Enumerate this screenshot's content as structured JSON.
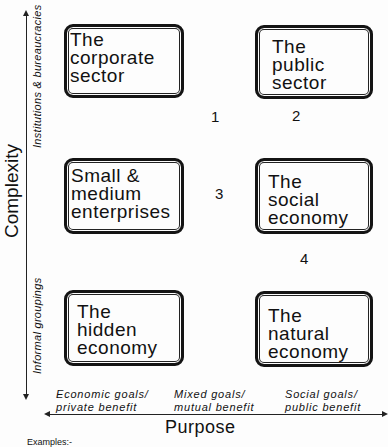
{
  "diagram": {
    "axes": {
      "vertical": {
        "title": "Complexity",
        "top_label": "Institutions & bureaucracies",
        "bottom_label": "Informal groupings"
      },
      "horizontal": {
        "title": "Purpose",
        "labels": [
          "Economic goals/\nprivate benefit",
          "Mixed goals/\nmutual benefit",
          "Social goals/\npublic benefit"
        ]
      }
    },
    "boxes": [
      {
        "label": "The\ncorporate\nsector"
      },
      {
        "label": "The\npublic\nsector"
      },
      {
        "label": "Small &\nmedium\nenterprises"
      },
      {
        "label": "The\nsocial\neconomy"
      },
      {
        "label": "The\nhidden\neconomy"
      },
      {
        "label": "The\nnatural\neconomy"
      }
    ],
    "numbers": [
      "1",
      "2",
      "3",
      "4"
    ],
    "footer": "Examples:-"
  }
}
